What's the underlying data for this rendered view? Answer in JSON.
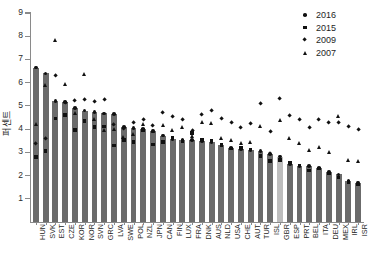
{
  "chart_data": {
    "type": "bar",
    "title": "",
    "xlabel": "",
    "ylabel": "퍼센트",
    "ylim": [
      0,
      9
    ],
    "yticks": [
      1,
      2,
      3,
      4,
      5,
      6,
      7,
      8,
      9
    ],
    "grid": false,
    "legend_position": "top-right",
    "categories": [
      "HUN",
      "SVK",
      "EST",
      "CZE",
      "KOR",
      "NOR",
      "SVN",
      "GRC",
      "LVA",
      "SWE",
      "POL",
      "NZL",
      "JPN",
      "CAN",
      "FIN",
      "LUX",
      "FRA",
      "DNK",
      "AUS",
      "NLD",
      "USA",
      "CHE",
      "AUT",
      "TUR",
      "ISL",
      "GBR",
      "ESP",
      "PRT",
      "BEL",
      "ITA",
      "DEU",
      "MEX",
      "IRL",
      "ISR"
    ],
    "series": [
      {
        "name": "2016",
        "marker": "circle",
        "type": "bar",
        "values": [
          6.65,
          6.4,
          5.2,
          5.18,
          4.92,
          4.8,
          4.73,
          4.68,
          4.64,
          4.1,
          4.05,
          4.0,
          3.92,
          3.72,
          3.58,
          3.55,
          3.52,
          3.5,
          3.45,
          3.3,
          3.18,
          3.14,
          3.1,
          3.05,
          2.92,
          2.82,
          2.5,
          2.42,
          2.4,
          2.32,
          2.15,
          2.05,
          1.78,
          1.7
        ]
      },
      {
        "name": "2015",
        "marker": "square",
        "values": [
          2.8,
          3.05,
          4.45,
          4.62,
          3.95,
          4.36,
          4.08,
          4.12,
          3.3,
          3.52,
          3.45,
          3.96,
          3.34,
          3.44,
          3.62,
          3.48,
          3.82,
          3.56,
          3.5,
          3.32,
          3.16,
          3.2,
          3.12,
          2.84,
          2.62,
          2.68,
          2.54,
          2.44,
          2.22,
          2.3,
          2.08,
          1.92,
          1.72,
          1.62
        ]
      },
      {
        "name": "2009",
        "marker": "diamond",
        "values": [
          3.38,
          3.6,
          6.32,
          5.16,
          5.22,
          5.26,
          5.18,
          5.26,
          4.18,
          4.02,
          4.26,
          4.42,
          4.16,
          4.72,
          4.55,
          4.4,
          3.92,
          4.62,
          4.8,
          4.45,
          4.28,
          4.08,
          4.24,
          5.12,
          3.88,
          5.3,
          4.58,
          4.42,
          4.08,
          4.4,
          4.26,
          4.3,
          4.1,
          3.98
        ]
      },
      {
        "name": "2007",
        "marker": "triangle",
        "values": [
          4.22,
          5.9,
          7.85,
          5.95,
          4.7,
          6.38,
          4.45,
          3.95,
          4.02,
          3.68,
          3.78,
          4.22,
          3.92,
          4.18,
          3.98,
          4.1,
          3.7,
          4.32,
          4.26,
          3.6,
          3.52,
          3.4,
          3.44,
          4.15,
          2.98,
          4.4,
          3.6,
          3.4,
          3.1,
          3.22,
          3.0,
          4.55,
          2.68,
          2.62
        ]
      }
    ],
    "highlight_category": "GBR",
    "colors": {
      "bar": "#6b6b6b",
      "bar_highlight": "#bdbdbd",
      "marker": "#111111",
      "axis": "#8a8a8a"
    }
  },
  "legend": {
    "items": [
      {
        "label": "2016",
        "marker": "circle"
      },
      {
        "label": "2015",
        "marker": "square"
      },
      {
        "label": "2009",
        "marker": "diamond"
      },
      {
        "label": "2007",
        "marker": "triangle"
      }
    ]
  }
}
